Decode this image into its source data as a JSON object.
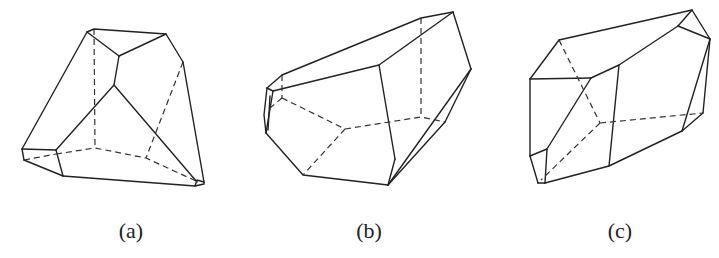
{
  "figure": {
    "panels": [
      {
        "id": "a",
        "label": "(a)",
        "description": "Polyhedron with triangular apex faces, viewed from above-front"
      },
      {
        "id": "b",
        "label": "(b)",
        "description": "Elongated polyhedron tilted to the right with hidden pentagonal base"
      },
      {
        "id": "c",
        "label": "(c)",
        "description": "Prismatic polyhedron with bevelled ends"
      }
    ],
    "colors": {
      "line": "#222222",
      "background": "#ffffff"
    },
    "line_styles": {
      "visible_edges": "solid",
      "hidden_edges": "dashed"
    }
  }
}
